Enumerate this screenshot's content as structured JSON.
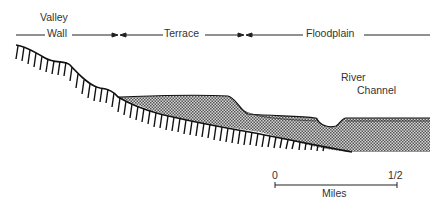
{
  "diagram": {
    "type": "geomorphology cross-section",
    "zones": [
      {
        "id": "valley-wall",
        "label_line1": "Valley",
        "label_line2": "Wall"
      },
      {
        "id": "terrace",
        "label": "Terrace"
      },
      {
        "id": "floodplain",
        "label": "Floodplain"
      }
    ],
    "river": {
      "label_line1": "River",
      "label_line2": "Channel"
    },
    "scale": {
      "start": "0",
      "end": "1/2",
      "unit": "Miles"
    },
    "colors": {
      "line": "#222222",
      "fill_dots": "#9a9a9a",
      "background": "#ffffff"
    }
  }
}
